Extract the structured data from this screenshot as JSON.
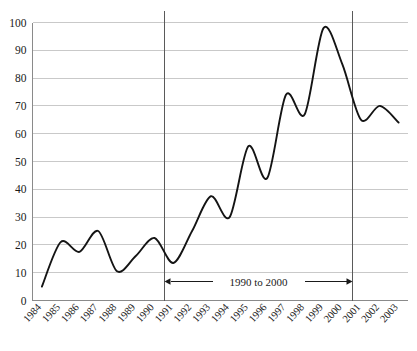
{
  "chart_data": {
    "type": "line",
    "title": "",
    "subtitle": "",
    "xlabel": "",
    "ylabel": "",
    "categories": [
      "1984",
      "1985",
      "1986",
      "1987",
      "1988",
      "1989",
      "1990",
      "1991",
      "1992",
      "1993",
      "1994",
      "1995",
      "1996",
      "1997",
      "1998",
      "1999",
      "2000",
      "2001",
      "2002",
      "2003"
    ],
    "values": [
      5,
      21,
      17.5,
      25,
      10.5,
      16,
      22.5,
      13.5,
      25,
      37.5,
      30,
      55.5,
      44,
      74,
      67,
      98,
      85,
      65,
      70,
      64
    ],
    "series": [
      {
        "name": "series-1",
        "values": [
          5,
          21,
          17.5,
          25,
          10.5,
          16,
          22.5,
          13.5,
          25,
          37.5,
          30,
          55.5,
          44,
          74,
          67,
          98,
          85,
          65,
          70,
          64
        ]
      }
    ],
    "ylim": [
      0,
      100
    ],
    "ytick_labels": [
      "0",
      "10",
      "20",
      "30",
      "40",
      "50",
      "60",
      "70",
      "80",
      "90",
      "100"
    ],
    "ytick_values": [
      0,
      10,
      20,
      30,
      40,
      50,
      60,
      70,
      80,
      90,
      100
    ],
    "xtick_labels": [
      "1984",
      "1985",
      "1986",
      "1987",
      "1988",
      "1989",
      "1990",
      "1991",
      "1992",
      "1993",
      "1994",
      "1995",
      "1996",
      "1997",
      "1998",
      "1999",
      "2000",
      "2001",
      "2002",
      "2003"
    ],
    "grid": "horizontal",
    "legend_position": "none",
    "line_color": "#141414",
    "grid_color": "#c9c9c9",
    "axis_color": "#8a8a8a",
    "interpolation": "smooth",
    "annotations": [
      {
        "label": "1990  to  2000",
        "type": "span-arrow",
        "from_category": "1990",
        "to_category": "2000",
        "value_position": 7
      }
    ],
    "reference_lines": [
      {
        "name": "vline-1990",
        "at_category": "1990",
        "orientation": "vertical",
        "color": "#5a5a5a"
      },
      {
        "name": "vline-2000",
        "at_category": "2000",
        "orientation": "vertical",
        "color": "#5a5a5a"
      }
    ]
  }
}
